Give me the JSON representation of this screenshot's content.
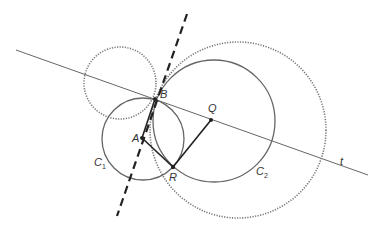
{
  "diagram": {
    "labels": {
      "B": "B",
      "Q": "Q",
      "A": "A",
      "R": "R",
      "C1_main": "C",
      "C1_sub": "1",
      "C2_main": "C",
      "C2_sub": "2",
      "t": "t"
    },
    "points": {
      "A": [
        142,
        138
      ],
      "B": [
        155,
        99
      ],
      "Q": [
        211,
        120
      ],
      "R": [
        173,
        167
      ]
    },
    "circles": {
      "C1": {
        "cx": 143,
        "cy": 139,
        "r": 41,
        "style": "solid"
      },
      "C2": {
        "cx": 214,
        "cy": 121,
        "r": 61,
        "style": "solid"
      },
      "small_dotted": {
        "cx": 120,
        "cy": 83,
        "r": 36,
        "style": "dotted"
      },
      "large_dotted": {
        "cx": 238,
        "cy": 130,
        "r": 88,
        "style": "dotted"
      }
    },
    "lines": {
      "t": {
        "from": [
          16,
          50
        ],
        "to": [
          368,
          175
        ],
        "style": "thin"
      },
      "dashed_axis": {
        "from": [
          187,
          14
        ],
        "to": [
          117,
          216
        ],
        "style": "dashed"
      },
      "segment_AR": {
        "from": [
          142,
          138
        ],
        "to": [
          173,
          167
        ]
      },
      "segment_RQ": {
        "from": [
          173,
          167
        ],
        "to": [
          211,
          120
        ]
      }
    },
    "colors": {
      "line": "#555555",
      "dotted": "#777777",
      "dashed": "#222222",
      "segment": "#222222"
    }
  }
}
